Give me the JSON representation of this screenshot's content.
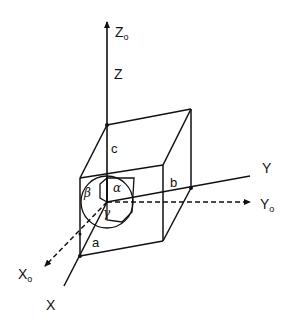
{
  "diagram": {
    "type": "unit-cell-coordinate-axes",
    "labels": {
      "z0": "Z",
      "z0_sub": "o",
      "z": "Z",
      "y": "Y",
      "y0": "Y",
      "y0_sub": "o",
      "x": "X",
      "x0": "X",
      "x0_sub": "o",
      "a": "a",
      "b": "b",
      "c": "c",
      "alpha": "α",
      "beta": "β",
      "gamma": "γ"
    },
    "colors": {
      "stroke": "#111111",
      "background": "#ffffff"
    }
  }
}
